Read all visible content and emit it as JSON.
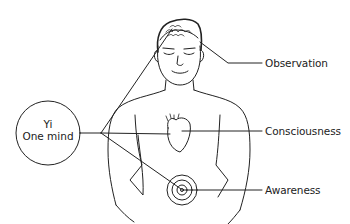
{
  "diagram": {
    "center_node": {
      "line1": "Yi",
      "line2": "One mind"
    },
    "labels": {
      "observation": "Observation",
      "consciousness": "Consciousness",
      "awareness": "Awareness"
    },
    "connections": [
      {
        "from": "Yi / One mind",
        "to": "head (brain)",
        "label": "Observation"
      },
      {
        "from": "Yi / One mind",
        "to": "heart",
        "label": "Consciousness"
      },
      {
        "from": "Yi / One mind",
        "to": "navel (lower abdomen)",
        "label": "Awareness"
      }
    ],
    "colors": {
      "line": "#222222",
      "background": "#ffffff"
    }
  }
}
